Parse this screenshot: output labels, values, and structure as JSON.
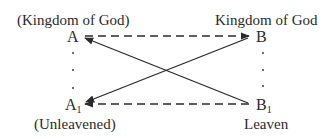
{
  "diagram": {
    "labels": {
      "top_left": "(Kingdom of God)",
      "top_right": "Kingdom of God",
      "bottom_left": "(Unleavened)",
      "bottom_right": "Leaven"
    },
    "nodes": {
      "A": "A",
      "B": "B",
      "A1_base": "A",
      "A1_sub": "1",
      "B1_base": "B",
      "B1_sub": "1"
    },
    "edges": [
      {
        "from": "A",
        "to": "B",
        "style": "dashed",
        "arrow": "B"
      },
      {
        "from": "A1",
        "to": "B1",
        "style": "dashed",
        "arrow": "A1"
      },
      {
        "from": "A",
        "to": "B1",
        "style": "solid",
        "arrow": "A"
      },
      {
        "from": "A1",
        "to": "B",
        "style": "solid",
        "arrow": "A1"
      }
    ],
    "colors": {
      "ink": "#2a2a2a",
      "background": "#ffffff"
    }
  }
}
